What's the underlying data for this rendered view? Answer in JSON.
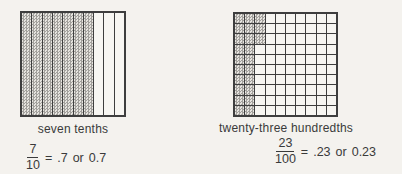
{
  "page": {
    "background": "#f4f2ee",
    "ink": "#3a3a3a",
    "shading_pattern": "gray-dot-stipple",
    "shading_color": "#a2a09c"
  },
  "figures": [
    {
      "id": "tenths",
      "grid": {
        "rows": 1,
        "cols": 10,
        "shaded_count": 7,
        "fill_order": "column-major"
      },
      "caption": "seven tenths",
      "equation": {
        "numerator": "7",
        "denominator": "10",
        "equals": "=",
        "decimal": ".7",
        "conjunction": "or",
        "decimal_alt": "0.7"
      }
    },
    {
      "id": "hundredths",
      "grid": {
        "rows": 10,
        "cols": 10,
        "shaded_count": 23,
        "fill_order": "column-major"
      },
      "caption": "twenty-three hundredths",
      "equation": {
        "numerator": "23",
        "denominator": "100",
        "equals": "=",
        "decimal": ".23",
        "conjunction": "or",
        "decimal_alt": "0.23"
      }
    }
  ]
}
